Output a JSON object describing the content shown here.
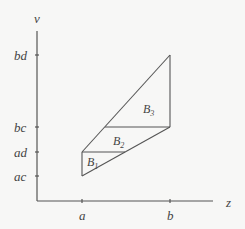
{
  "diagram": {
    "axes": {
      "y_label": "v",
      "x_label": "z",
      "y_ticks": [
        "bd",
        "bc",
        "ad",
        "ac"
      ],
      "x_ticks": [
        "a",
        "b"
      ]
    },
    "regions": [
      {
        "name": "B",
        "sub": "1"
      },
      {
        "name": "B",
        "sub": "2"
      },
      {
        "name": "B",
        "sub": "3"
      }
    ],
    "colors": {
      "background": "#f7f7f6",
      "lines": "#555555",
      "text": "#444444"
    }
  }
}
